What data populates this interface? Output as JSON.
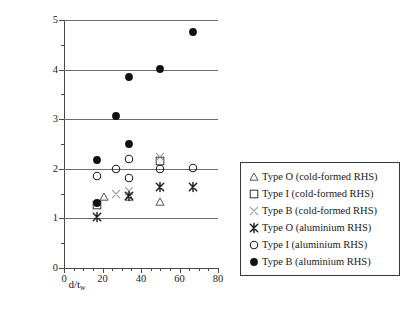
{
  "chart_data": {
    "type": "scatter",
    "title": "",
    "xlabel": "d/t_w",
    "xlabel_main": "d/t",
    "xlabel_sub": "w",
    "ylabel_line1": "Ratio of Bearing Capacity",
    "ylabel_line2": "(CFRP Strengthened/Bare RHS)",
    "xlim": [
      0,
      80
    ],
    "ylim": [
      0,
      5
    ],
    "xticks": [
      0,
      20,
      40,
      60,
      80
    ],
    "xtick_labels": [
      "0",
      "20",
      "40",
      "60",
      "80"
    ],
    "xminor_step": 5,
    "yticks": [
      0,
      1,
      2,
      3,
      4,
      5
    ],
    "ytick_labels": [
      "0",
      "1",
      "2",
      "3",
      "4",
      "5"
    ],
    "yminor_step": 0.5,
    "gridlines_y": [
      1,
      2,
      3,
      4,
      5
    ],
    "grid": "horizontal",
    "legend_position": "right-outside",
    "series": [
      {
        "name": "Type O (cold-formed RHS)",
        "marker": "open-triangle",
        "color": "#555555",
        "points": [
          {
            "x": 21,
            "y": 1.44
          },
          {
            "x": 34,
            "y": 1.44
          },
          {
            "x": 50,
            "y": 1.34
          }
        ]
      },
      {
        "name": "Type I (cold-formed RHS)",
        "marker": "open-square",
        "color": "#333333",
        "points": [
          {
            "x": 17,
            "y": 1.27
          },
          {
            "x": 50,
            "y": 2.15
          }
        ]
      },
      {
        "name": "Type B (cold-formed RHS)",
        "marker": "light-cross",
        "color": "#999999",
        "points": [
          {
            "x": 27,
            "y": 1.5
          },
          {
            "x": 34,
            "y": 1.56
          },
          {
            "x": 50,
            "y": 2.24
          }
        ]
      },
      {
        "name": "Type O (aluminium RHS)",
        "marker": "bold-asterisk",
        "color": "#222222",
        "points": [
          {
            "x": 17,
            "y": 1.02
          },
          {
            "x": 34,
            "y": 1.45
          },
          {
            "x": 50,
            "y": 1.64
          },
          {
            "x": 67,
            "y": 1.63
          }
        ]
      },
      {
        "name": "Type I (aluminium RHS)",
        "marker": "open-circle",
        "color": "#222222",
        "points": [
          {
            "x": 17,
            "y": 1.86
          },
          {
            "x": 27,
            "y": 2.0
          },
          {
            "x": 34,
            "y": 2.19
          },
          {
            "x": 34,
            "y": 1.82
          },
          {
            "x": 50,
            "y": 2.0
          },
          {
            "x": 67,
            "y": 2.01
          }
        ]
      },
      {
        "name": "Type B (aluminium RHS)",
        "marker": "filled-circle",
        "color": "#111111",
        "points": [
          {
            "x": 17,
            "y": 2.17
          },
          {
            "x": 17,
            "y": 1.32
          },
          {
            "x": 27,
            "y": 3.06
          },
          {
            "x": 34,
            "y": 3.86
          },
          {
            "x": 34,
            "y": 2.49
          },
          {
            "x": 50,
            "y": 4.01
          },
          {
            "x": 67,
            "y": 4.76
          }
        ]
      }
    ]
  }
}
